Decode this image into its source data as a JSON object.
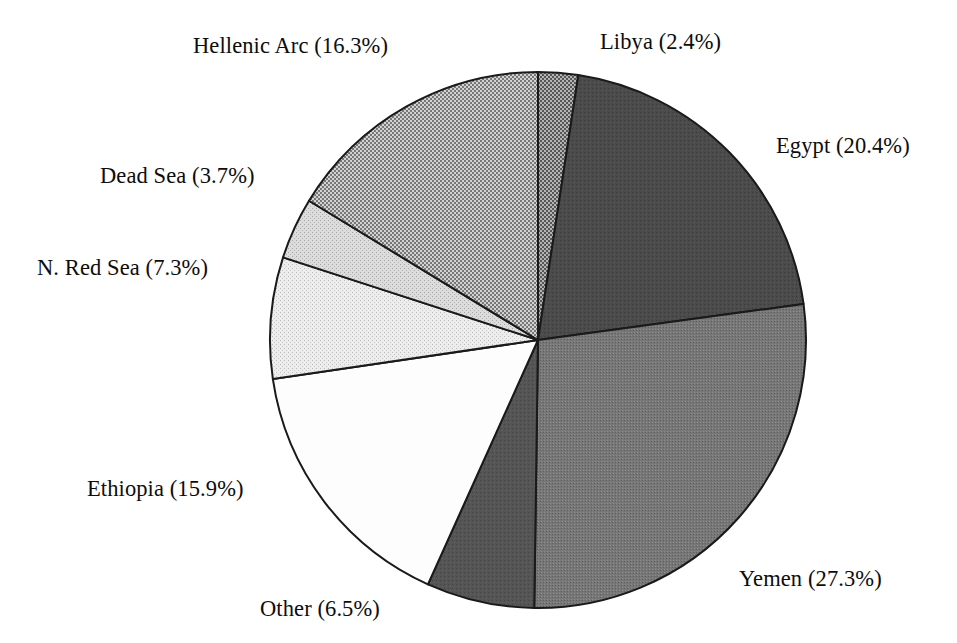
{
  "chart_data": {
    "type": "pie",
    "title": "",
    "subtitle": "",
    "xlabel": "",
    "ylabel": "",
    "legend_position": "none",
    "grid": false,
    "units": "percent",
    "label_format": "{name} ({value}%)",
    "start_angle_deg": 0,
    "direction": "clockwise",
    "total": 99.8,
    "categories": [
      "Libya",
      "Egypt",
      "Yemen",
      "Other",
      "Ethiopia",
      "N. Red Sea",
      "Dead Sea",
      "Hellenic Arc"
    ],
    "values": [
      2.4,
      20.4,
      27.3,
      6.5,
      15.9,
      7.3,
      3.7,
      16.3
    ],
    "slices": [
      {
        "name": "Libya",
        "value": 2.4,
        "label": "Libya (2.4%)",
        "fill": "#8f8f8f",
        "pattern": "checker-medium",
        "start_deg": 0.0,
        "end_deg": 8.66
      },
      {
        "name": "Egypt",
        "value": 20.4,
        "label": "Egypt (20.4%)",
        "fill": "#4b4b4b",
        "pattern": "solid-dark",
        "start_deg": 8.66,
        "end_deg": 82.28
      },
      {
        "name": "Yemen",
        "value": 27.3,
        "label": "Yemen (27.3%)",
        "fill": "#737373",
        "pattern": "noise-mid",
        "start_deg": 82.28,
        "end_deg": 180.8
      },
      {
        "name": "Other",
        "value": 6.5,
        "label": "Other (6.5%)",
        "fill": "#555555",
        "pattern": "solid-dark",
        "start_deg": 180.8,
        "end_deg": 204.25
      },
      {
        "name": "Ethiopia",
        "value": 15.9,
        "label": "Ethiopia (15.9%)",
        "fill": "#fbfbfb",
        "pattern": "white",
        "start_deg": 204.25,
        "end_deg": 261.62
      },
      {
        "name": "N. Red Sea",
        "value": 7.3,
        "label": "N. Red Sea (7.3%)",
        "fill": "#e6e6e6",
        "pattern": "stipple-light",
        "start_deg": 261.62,
        "end_deg": 287.95
      },
      {
        "name": "Dead Sea",
        "value": 3.7,
        "label": "Dead Sea (3.7%)",
        "fill": "#cfcfcf",
        "pattern": "stipple-lightmid",
        "start_deg": 287.95,
        "end_deg": 301.3
      },
      {
        "name": "Hellenic Arc",
        "value": 16.3,
        "label": "Hellenic Arc (16.3%)",
        "fill": "#a8a8a8",
        "pattern": "checker-light",
        "start_deg": 301.3,
        "end_deg": 360.0
      }
    ],
    "geometry": {
      "center_x": 538,
      "center_y": 340,
      "radius": 268
    },
    "colors": {
      "background": "#ffffff",
      "outline": "#1a1a1a",
      "text": "#0d0d0d"
    }
  },
  "labels": {
    "libya": "Libya (2.4%)",
    "egypt": "Egypt (20.4%)",
    "yemen": "Yemen (27.3%)",
    "other": "Other (6.5%)",
    "ethiopia": "Ethiopia (15.9%)",
    "n_red_sea": "N. Red Sea (7.3%)",
    "dead_sea": "Dead Sea (3.7%)",
    "hellenic_arc": "Hellenic Arc (16.3%)"
  }
}
